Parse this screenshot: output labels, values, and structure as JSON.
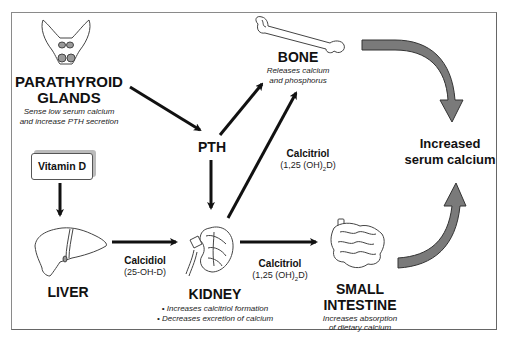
{
  "nodes": {
    "parathyroid": {
      "title_line1": "PARATHYROID",
      "title_line2": "GLANDS",
      "desc_line1": "Sense low serum calcium",
      "desc_line2": "and  increase PTH secretion",
      "icon": "parathyroid-icon"
    },
    "pth": {
      "label": "PTH"
    },
    "bone": {
      "title": "BONE",
      "desc_line1": "Releases calcium",
      "desc_line2": "and phosphorus",
      "icon": "bone-icon"
    },
    "vitamin_d": {
      "label": "Vitamin D"
    },
    "liver": {
      "title": "LIVER",
      "icon": "liver-icon"
    },
    "kidney": {
      "title": "KIDNEY",
      "bullet1": "• Increases calcitriol formation",
      "bullet2": "• Decreases excretion of calcium",
      "icon": "kidney-icon"
    },
    "intestine": {
      "title_line1": "SMALL",
      "title_line2": "INTESTINE",
      "desc_line1": "Increases absorption",
      "desc_line2": "of dietary calcium",
      "icon": "intestine-icon"
    },
    "result": {
      "line1": "Increased",
      "line2": "serum calcium"
    }
  },
  "edges": {
    "calcidiol": {
      "label": "Calcidiol",
      "sub": "(25-OH-D)"
    },
    "calcitriol_bone": {
      "label": "Calcitriol",
      "sub_pre": "(1,25 (OH)",
      "sub_sub": "2",
      "sub_post": "D)"
    },
    "calcitriol_intestine": {
      "label": "Calcitriol",
      "sub_pre": "(1,25 (OH)",
      "sub_sub": "2",
      "sub_post": "D)"
    }
  },
  "colors": {
    "arrow": "#111111",
    "big_arrow": "#7a7a7a",
    "organ_fill": "#ffffff",
    "gland_fill": "#9a9a9a"
  }
}
